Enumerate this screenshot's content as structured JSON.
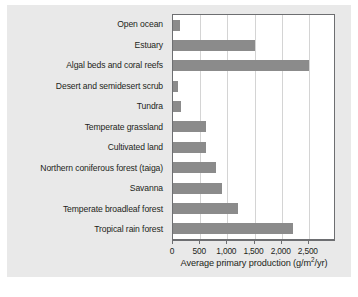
{
  "chart_data": {
    "type": "bar",
    "orientation": "horizontal",
    "title": "",
    "xlabel": "Average primary production (g/m2/yr)",
    "xlabel_parts": {
      "before": "Average primary production (g/m",
      "sup": "2",
      "after": "/yr)"
    },
    "ylabel": "",
    "categories": [
      "Open ocean",
      "Estuary",
      "Algal beds and coral reefs",
      "Desert and semidesert scrub",
      "Tundra",
      "Temperate grassland",
      "Cultivated land",
      "Northern coniferous forest (taiga)",
      "Savanna",
      "Temperate broadleaf forest",
      "Tropical rain forest"
    ],
    "values": [
      125,
      1500,
      2500,
      90,
      140,
      600,
      600,
      800,
      900,
      1200,
      2200
    ],
    "xlim": [
      0,
      3000
    ],
    "xticks": [
      0,
      500,
      1000,
      1500,
      2000,
      2500
    ],
    "xticklabels": [
      "0",
      "500",
      "1,000",
      "1,500",
      "2,000",
      "2,500"
    ],
    "grid": "vertical",
    "legend": "none",
    "bar_color": "#8b8b8b",
    "panel_color": "#e9e9e9",
    "plot_background": "#ffffff",
    "axis_color": "#6d6e71",
    "gridline_color": "#d4d4d4",
    "text_color": "#231f20"
  }
}
